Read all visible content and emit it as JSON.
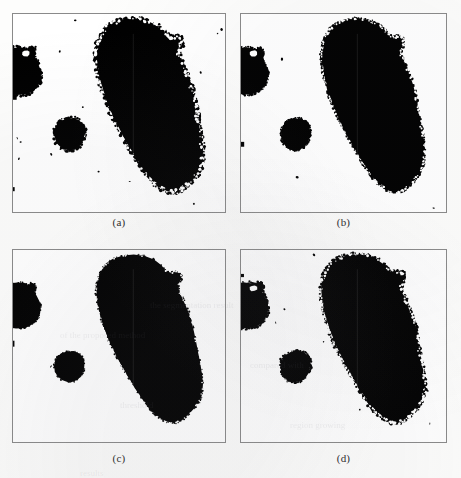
{
  "figure": {
    "kind": "binary-segmentation-comparison",
    "layout": {
      "rows": 2,
      "cols": 2
    },
    "background_color": "#fdfdfc",
    "foreground_color": "#000000",
    "border_color": "#8a8a8a",
    "panels": [
      {
        "id": "a",
        "caption": "(a)",
        "frame": {
          "x": 12,
          "y": 13,
          "w": 214,
          "h": 200
        },
        "caption_y": 216,
        "objects": [
          {
            "name": "large-elongated-blob",
            "role": "main-region",
            "centroid_pct": [
              61,
              50
            ],
            "area_pct": 22.5
          },
          {
            "name": "small-round-blob",
            "role": "secondary-region",
            "centroid_pct": [
              24,
              62
            ],
            "area_pct": 2.1
          },
          {
            "name": "left-edge-blob",
            "role": "edge-region",
            "centroid_pct": [
              4,
              28
            ],
            "area_pct": 2.8
          }
        ],
        "noise_speckles": 16,
        "noise_level": "high"
      },
      {
        "id": "b",
        "caption": "(b)",
        "frame": {
          "x": 240,
          "y": 13,
          "w": 207,
          "h": 200
        },
        "caption_y": 216,
        "objects": [
          {
            "name": "large-elongated-blob",
            "role": "main-region",
            "centroid_pct": [
              62,
              50
            ],
            "area_pct": 23.8
          },
          {
            "name": "small-round-blob",
            "role": "secondary-region",
            "centroid_pct": [
              23,
              61
            ],
            "area_pct": 2.3
          },
          {
            "name": "left-edge-blob",
            "role": "edge-region",
            "centroid_pct": [
              3,
              28
            ],
            "area_pct": 2.2
          }
        ],
        "noise_speckles": 6,
        "noise_level": "low"
      },
      {
        "id": "c",
        "caption": "(c)",
        "frame": {
          "x": 12,
          "y": 249,
          "w": 214,
          "h": 194
        },
        "caption_y": 452,
        "objects": [
          {
            "name": "large-elongated-blob",
            "role": "main-region",
            "centroid_pct": [
              62,
              49
            ],
            "area_pct": 24.6
          },
          {
            "name": "small-round-blob",
            "role": "secondary-region",
            "centroid_pct": [
              24,
              61
            ],
            "area_pct": 2.2
          },
          {
            "name": "left-edge-blob",
            "role": "edge-region",
            "centroid_pct": [
              3,
              27
            ],
            "area_pct": 2.0
          }
        ],
        "noise_speckles": 2,
        "noise_level": "none"
      },
      {
        "id": "d",
        "caption": "(d)",
        "frame": {
          "x": 240,
          "y": 249,
          "w": 207,
          "h": 194
        },
        "caption_y": 452,
        "objects": [
          {
            "name": "large-elongated-blob",
            "role": "main-region",
            "centroid_pct": [
              61,
              50
            ],
            "area_pct": 23.2
          },
          {
            "name": "small-round-blob",
            "role": "secondary-region",
            "centroid_pct": [
              23,
              62
            ],
            "area_pct": 2.2
          },
          {
            "name": "left-edge-blob",
            "role": "edge-region",
            "centroid_pct": [
              4,
              28
            ],
            "area_pct": 2.6
          }
        ],
        "noise_speckles": 12,
        "noise_level": "medium"
      }
    ]
  },
  "bleed_text": [
    {
      "text": "the segmentation result",
      "x": 150,
      "y": 300
    },
    {
      "text": "of the proposed method",
      "x": 60,
      "y": 330
    },
    {
      "text": "compared with",
      "x": 250,
      "y": 360
    },
    {
      "text": "threshold",
      "x": 120,
      "y": 400
    },
    {
      "text": "region growing",
      "x": 290,
      "y": 420
    },
    {
      "text": "results",
      "x": 80,
      "y": 468
    }
  ]
}
